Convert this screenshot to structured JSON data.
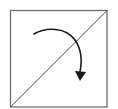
{
  "diagram": {
    "colors": {
      "background": "#ffffff",
      "square_stroke": "#6e6e6e",
      "diagonal_stroke": "#4a4a4a",
      "arrow_stroke": "#1a1a1a"
    },
    "square": {
      "x": 10,
      "y": 10,
      "size": 97
    },
    "diagonal": {
      "from": [
        10,
        107
      ],
      "to": [
        107,
        10
      ]
    },
    "arrow": {
      "direction": "clockwise",
      "start": [
        34,
        34
      ],
      "end": [
        80,
        72
      ],
      "arrowhead_tip": [
        80,
        80
      ]
    }
  }
}
